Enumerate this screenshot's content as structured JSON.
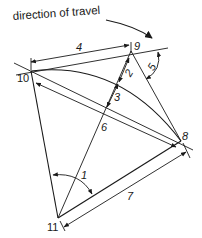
{
  "title": "direction of travel",
  "points": {
    "p8": "8",
    "p9": "9",
    "p10": "10",
    "p11": "11"
  },
  "measurements": {
    "m1": "1",
    "m2": "2",
    "m3": "3",
    "m4": "4",
    "m5": "5",
    "m6": "6",
    "m7": "7"
  },
  "colors": {
    "line": "#1a1a1a",
    "background": "#ffffff"
  }
}
